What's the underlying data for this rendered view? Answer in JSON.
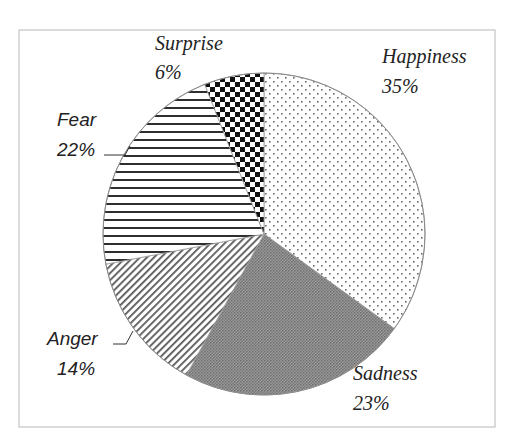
{
  "chart_data": {
    "type": "pie",
    "title": "",
    "categories": [
      "Happiness",
      "Sadness",
      "Anger",
      "Fear",
      "Surprise"
    ],
    "values": [
      35,
      23,
      14,
      22,
      6
    ],
    "unit": "%",
    "start_angle_deg": 0,
    "direction": "clockwise",
    "legend": "none",
    "slices": [
      {
        "label": "Happiness",
        "value": 35,
        "value_label": "35%",
        "pattern": "dots"
      },
      {
        "label": "Sadness",
        "value": 23,
        "value_label": "23%",
        "pattern": "dense-gray"
      },
      {
        "label": "Anger",
        "value": 14,
        "value_label": "14%",
        "pattern": "diagonal-stripes"
      },
      {
        "label": "Fear",
        "value": 22,
        "value_label": "22%",
        "pattern": "horizontal-stripes"
      },
      {
        "label": "Surprise",
        "value": 6,
        "value_label": "6%",
        "pattern": "checkerboard"
      }
    ]
  },
  "labels": {
    "happiness": {
      "name": "Happiness",
      "pct": "35%"
    },
    "sadness": {
      "name": "Sadness",
      "pct": "23%"
    },
    "anger": {
      "name": "Anger",
      "pct": "14%"
    },
    "fear": {
      "name": "Fear",
      "pct": "22%"
    },
    "surprise": {
      "name": "Surprise",
      "pct": "6%"
    }
  },
  "colors": {
    "frame": "#b8b8b8",
    "outline": "#8a8a8a",
    "ink": "#222222",
    "sadness_fill": "#8f8f8f"
  }
}
